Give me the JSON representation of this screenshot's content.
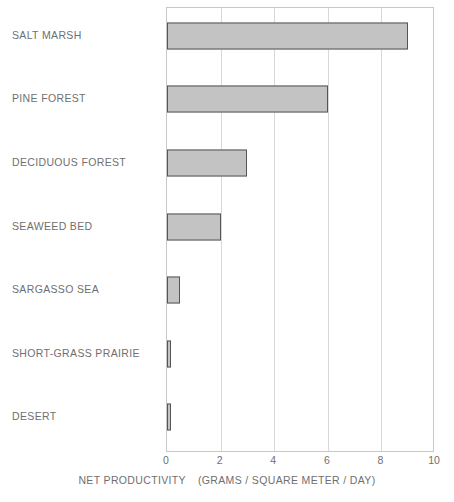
{
  "chart_data": {
    "type": "bar",
    "orientation": "horizontal",
    "title": "",
    "xlabel": "NET PRODUCTIVITY   (GRAMS / SQUARE METER / DAY)",
    "ylabel": "",
    "xlim": [
      0,
      10
    ],
    "xticks": [
      "0",
      "2",
      "4",
      "6",
      "8",
      "10"
    ],
    "xtick_values": [
      0,
      2,
      4,
      6,
      8,
      10
    ],
    "grid": true,
    "legend": "none",
    "categories": [
      "SALT MARSH",
      "PINE FOREST",
      "DECIDUOUS FOREST",
      "SEAWEED BED",
      "SARGASSO SEA",
      "SHORT-GRASS PRAIRIE",
      "DESERT"
    ],
    "values": [
      9.0,
      6.0,
      3.0,
      2.0,
      0.5,
      0.15,
      0.15
    ],
    "bar_fill_color": "#c3c3c3",
    "bar_edge_color": "#555555",
    "grid_color": "#d8d8d8",
    "axis_color": "#c8c8c8",
    "text_color": "#6f6f6f"
  },
  "axis_title": {
    "main": "NET PRODUCTIVITY",
    "units": "(GRAMS / SQUARE METER / DAY)"
  }
}
